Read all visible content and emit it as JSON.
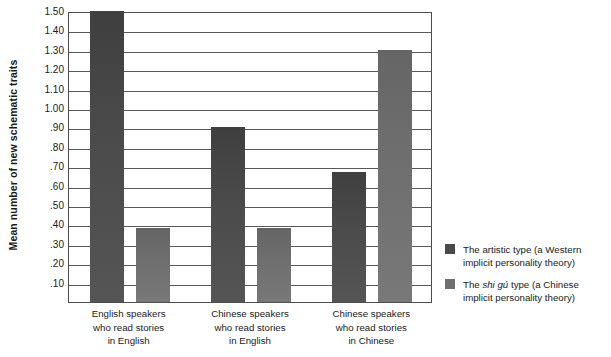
{
  "chart_data": {
    "type": "bar",
    "title": "",
    "xlabel": "",
    "ylabel": "Mean number of new schematic traits",
    "ylim": [
      0.0,
      1.5
    ],
    "grid": true,
    "legend_position": "right",
    "y_ticks": [
      {
        "value": 1.5,
        "label": "1.50"
      },
      {
        "value": 1.4,
        "label": "1.40"
      },
      {
        "value": 1.3,
        "label": "1.30"
      },
      {
        "value": 1.2,
        "label": "1.20"
      },
      {
        "value": 1.1,
        "label": "1.10"
      },
      {
        "value": 1.0,
        "label": "1.00"
      },
      {
        "value": 0.9,
        "label": ".90"
      },
      {
        "value": 0.8,
        "label": ".80"
      },
      {
        "value": 0.7,
        "label": ".70"
      },
      {
        "value": 0.6,
        "label": ".60"
      },
      {
        "value": 0.5,
        "label": ".50"
      },
      {
        "value": 0.4,
        "label": ".40"
      },
      {
        "value": 0.3,
        "label": ".30"
      },
      {
        "value": 0.2,
        "label": ".20"
      },
      {
        "value": 0.1,
        "label": ".10"
      }
    ],
    "categories": [
      "English speakers\nwho read stories\nin English",
      "Chinese speakers\nwho read stories\nin English",
      "Chinese speakers\nwho read stories\nin Chinese"
    ],
    "category_lines": [
      [
        "English speakers",
        "who read stories",
        "in English"
      ],
      [
        "Chinese speakers",
        "who read stories",
        "in English"
      ],
      [
        "Chinese speakers",
        "who read stories",
        "in Chinese"
      ]
    ],
    "series": [
      {
        "name": "The artistic type (a Western implicit personality theory)",
        "short_name": "artistic",
        "color": "#4a4a4a",
        "values": [
          1.5,
          0.9,
          0.67
        ]
      },
      {
        "name": "The shi gú type (a Chinese implicit personality theory)",
        "short_name": "shigu",
        "color": "#6e6e6e",
        "values": [
          0.38,
          0.38,
          1.3
        ]
      }
    ]
  },
  "legend": {
    "entries": [
      {
        "swatch_class": "artistic",
        "prefix": "The artistic type (a Western implicit ",
        "italic": "",
        "suffix": "personality theory)"
      },
      {
        "swatch_class": "shigu",
        "prefix": "The ",
        "italic": "shi gú",
        "suffix": " type (a Chinese implicit personality theory)"
      }
    ]
  }
}
